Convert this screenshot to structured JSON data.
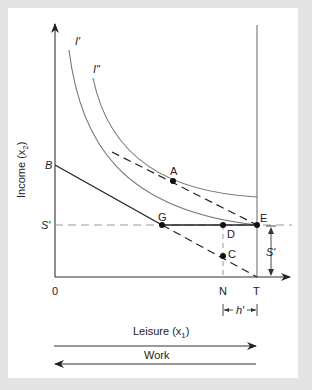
{
  "diagram": {
    "y_axis_label": "Income (x",
    "y_axis_label_sub": "2",
    "y_axis_label_end": ")",
    "x_axis_label": "Leisure (x",
    "x_axis_label_sub": "1",
    "x_axis_label_end": ")",
    "work_label": "Work",
    "origin_label": "0",
    "curve_labels": {
      "I_prime": "I′",
      "I_double_prime": "I″"
    },
    "axis_point_labels": {
      "B": "B",
      "S_prime_left": "S′",
      "N": "N",
      "T": "T"
    },
    "point_labels": {
      "A": "A",
      "G": "G",
      "D": "D",
      "E": "E",
      "C": "C"
    },
    "bracket_labels": {
      "S_prime_right": "S′",
      "h_prime": "h′"
    },
    "colors": {
      "background": "#e4e4e4",
      "panel": "#ffffff",
      "axis": "#333333",
      "curve": "#777777",
      "budget": "#222222",
      "dashed_guide": "#999999"
    }
  }
}
